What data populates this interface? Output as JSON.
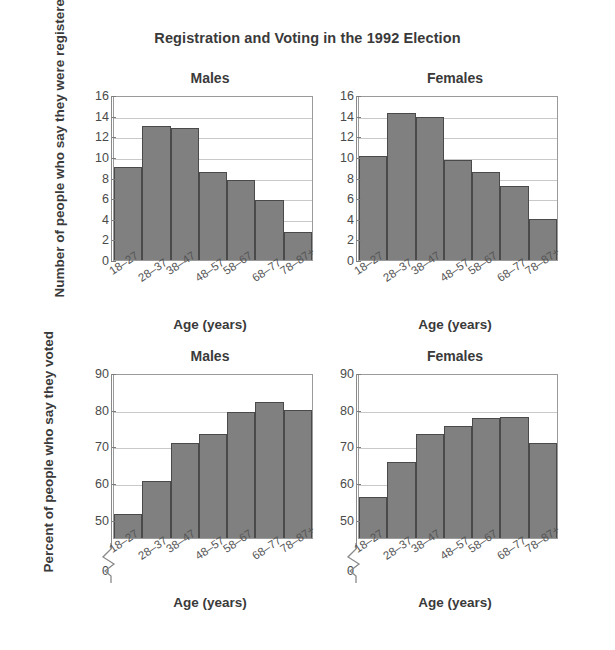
{
  "figure": {
    "title": "Registration and Voting in the 1992 Election"
  },
  "panels": {
    "top_left": {
      "title": "Males"
    },
    "top_right": {
      "title": "Females"
    },
    "bottom_left": {
      "title": "Males"
    },
    "bottom_right": {
      "title": "Females"
    }
  },
  "axis_titles": {
    "registered_y": "Number of people who say they were registered (millions)",
    "voted_y": "Percent of people who say they voted",
    "x": "Age (years)"
  },
  "colors": {
    "bar_fill": "#808080",
    "bar_edge": "#4a4a4a",
    "grid": "#c9c9c9",
    "text": "#3a3a3a"
  },
  "chart_data": [
    {
      "type": "bar",
      "title": "Males",
      "subplot": "top-left",
      "categories": [
        "18–27",
        "28–37",
        "38–47",
        "48–57",
        "58–67",
        "68–77",
        "78–87+"
      ],
      "values": [
        9.0,
        13.0,
        12.8,
        8.5,
        7.8,
        5.8,
        2.7
      ],
      "xlabel": "Age (years)",
      "ylabel": "Number of people who say they were registered (millions)",
      "ylim": [
        0,
        16
      ],
      "yticks": [
        0,
        2,
        4,
        6,
        8,
        10,
        12,
        14,
        16
      ],
      "grid": true,
      "legend": "none"
    },
    {
      "type": "bar",
      "title": "Females",
      "subplot": "top-right",
      "categories": [
        "18–27",
        "28–37",
        "38–47",
        "48–57",
        "58–67",
        "68–77",
        "78–87+"
      ],
      "values": [
        10.1,
        14.3,
        13.9,
        9.7,
        8.5,
        7.2,
        4.0
      ],
      "xlabel": "Age (years)",
      "ylabel": "Number of people who say they were registered (millions)",
      "ylim": [
        0,
        16
      ],
      "yticks": [
        0,
        2,
        4,
        6,
        8,
        10,
        12,
        14,
        16
      ],
      "grid": true,
      "legend": "none"
    },
    {
      "type": "bar",
      "title": "Males",
      "subplot": "bottom-left",
      "categories": [
        "18–27",
        "28–37",
        "38–47",
        "48–57",
        "58–67",
        "68–77",
        "78–87+"
      ],
      "values": [
        51.5,
        60.5,
        70.8,
        73.3,
        79.3,
        82.0,
        80.0
      ],
      "xlabel": "Age (years)",
      "ylabel": "Percent of people who say they voted",
      "ylim": [
        45,
        90
      ],
      "yticks": [
        0,
        50,
        60,
        70,
        80,
        90
      ],
      "axis_break": true,
      "grid": true,
      "legend": "none"
    },
    {
      "type": "bar",
      "title": "Females",
      "subplot": "bottom-right",
      "categories": [
        "18–27",
        "28–37",
        "38–47",
        "48–57",
        "58–67",
        "68–77",
        "78–87+"
      ],
      "values": [
        56.2,
        65.7,
        73.5,
        75.6,
        77.8,
        78.0,
        71.0
      ],
      "xlabel": "Age (years)",
      "ylabel": "Percent of people who say they voted",
      "ylim": [
        45,
        90
      ],
      "yticks": [
        0,
        50,
        60,
        70,
        80,
        90
      ],
      "axis_break": true,
      "grid": true,
      "legend": "none"
    }
  ]
}
